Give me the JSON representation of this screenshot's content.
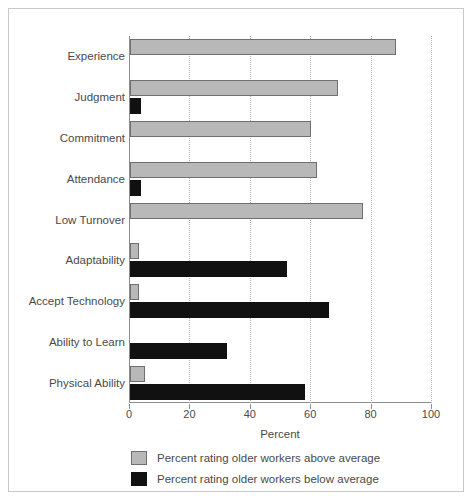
{
  "chart_data": {
    "type": "bar",
    "orientation": "horizontal",
    "title": "",
    "xlabel": "Percent",
    "ylabel": "",
    "xlim": [
      0,
      100
    ],
    "xticks": [
      0,
      20,
      40,
      60,
      80,
      100
    ],
    "xticklabels": [
      "0",
      "20",
      "40",
      "60",
      "80",
      "100"
    ],
    "grid": "vertical-dotted",
    "legend_position": "below-axes",
    "categories": [
      "Experience",
      "Judgment",
      "Commitment",
      "Attendance",
      "Low Turnover",
      "Adaptability",
      "Accept Technology",
      "Ability to Learn",
      "Physical Ability"
    ],
    "series": [
      {
        "name": "Percent rating older workers above average",
        "color": "#b8b8b8",
        "values": [
          88,
          69,
          60,
          62,
          77,
          3,
          3,
          0,
          5
        ]
      },
      {
        "name": "Percent rating older workers below average",
        "color": "#111111",
        "values": [
          0,
          3.5,
          0,
          3.5,
          0,
          52,
          66,
          32,
          58
        ]
      }
    ]
  },
  "axis": {
    "x_title": "Percent"
  },
  "legend": {
    "entries": [
      {
        "label": "Percent rating older workers above average",
        "swatch": "gray"
      },
      {
        "label": "Percent rating older workers below average",
        "swatch": "black"
      }
    ]
  }
}
